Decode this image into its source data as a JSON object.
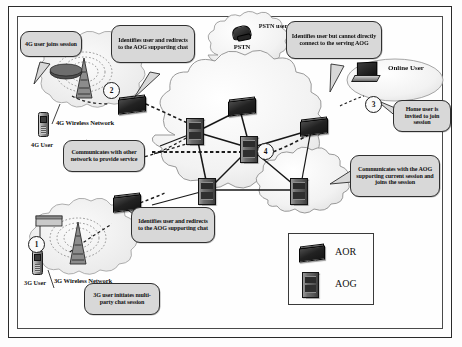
{
  "diagram": {
    "frame_color": "#2a2a2a",
    "callout_fill": "#d8d8d8"
  },
  "callouts": [
    {
      "id": "c1",
      "text": "4G user joins session"
    },
    {
      "id": "c2",
      "text": "Identifies user and redirects to the AOG supporting chat"
    },
    {
      "id": "c3",
      "text": "Identifies user but cannot directly connect to the serving AOG"
    },
    {
      "id": "c4",
      "text": "Home user is invited to join session"
    },
    {
      "id": "c5",
      "text": "Communicates with other network to provide service"
    },
    {
      "id": "c6",
      "text": "Identifies user and redirects to the AOG supporting chat"
    },
    {
      "id": "c7",
      "text": "Communicates with the AOG supporting current session and joins the session"
    },
    {
      "id": "c8",
      "text": "3G user initiates multi-party chat session"
    }
  ],
  "network_labels": [
    {
      "id": "n1",
      "text": "4G Wireless Network"
    },
    {
      "id": "n2",
      "text": "3G Wireless Network"
    },
    {
      "id": "n3",
      "text": "PSTN"
    }
  ],
  "node_labels": [
    {
      "id": "u1",
      "text": "4G User"
    },
    {
      "id": "u2",
      "text": "3G User"
    },
    {
      "id": "u3",
      "text": "PSTN user"
    },
    {
      "id": "u4",
      "text": "Online User"
    }
  ],
  "steps": [
    {
      "id": "s1",
      "number": "1"
    },
    {
      "id": "s2",
      "number": "2"
    },
    {
      "id": "s3",
      "number": "3"
    },
    {
      "id": "s4",
      "number": "4"
    }
  ],
  "legend": {
    "items": [
      {
        "id": "l1",
        "label": "AOR",
        "icon": "router-icon"
      },
      {
        "id": "l2",
        "label": "AOG",
        "icon": "gateway-icon"
      }
    ]
  }
}
